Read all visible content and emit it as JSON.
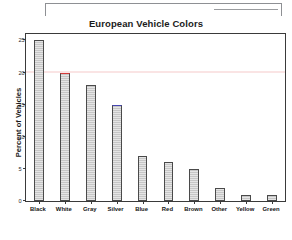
{
  "window": {
    "chrome_brackets": [
      {
        "name": "toolbar-bracket-main"
      },
      {
        "name": "toolbar-bracket-secondary"
      }
    ]
  },
  "chart_data": {
    "type": "bar",
    "title": "European Vehicle Colors",
    "xlabel": "",
    "ylabel": "Percent of Vehicles",
    "categories": [
      "Black",
      "White",
      "Gray",
      "Silver",
      "Blue",
      "Red",
      "Brown",
      "Other",
      "Yellow",
      "Green"
    ],
    "values": [
      25,
      20,
      18,
      15,
      7,
      6,
      5,
      2,
      1,
      1
    ],
    "ylim": [
      0,
      26
    ],
    "yticks": [
      0,
      5,
      10,
      15,
      20,
      25
    ],
    "ytick_labels": [
      "0",
      "5",
      "10",
      "15",
      "20",
      "25"
    ],
    "grid": false,
    "legend": null,
    "bar_fill_color": "#c6c6c6",
    "bar_edge_color": "#4a4a4a",
    "highlights": [
      {
        "category": "White",
        "edge_color": "#d83b3b"
      },
      {
        "category": "Silver",
        "edge_color": "#4646b4"
      }
    ]
  }
}
